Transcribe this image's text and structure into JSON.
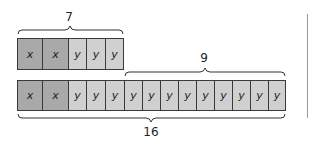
{
  "diagram": {
    "top_row": {
      "brace_label": "7",
      "cells": [
        "x",
        "x",
        "y",
        "y",
        "y"
      ]
    },
    "bottom_row": {
      "upper_brace_label": "9",
      "lower_brace_label": "16",
      "cells": [
        "x",
        "x",
        "y",
        "y",
        "y",
        "y",
        "y",
        "y",
        "y",
        "y",
        "y",
        "y",
        "y",
        "y"
      ]
    },
    "colors": {
      "x_cell": "#a9a9a9",
      "y_cell": "#d0d0d0",
      "border": "#3a3a3a"
    }
  }
}
